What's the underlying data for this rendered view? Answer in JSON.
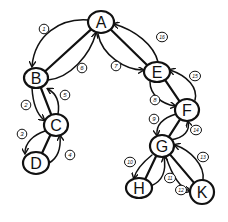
{
  "diagram": {
    "type": "directed-graph-traversal",
    "stroke_color": "#111111",
    "background": "#ffffff",
    "nodes": [
      {
        "id": "A",
        "label": "A",
        "x": 101,
        "y": 22,
        "rx": 13,
        "ry": 11
      },
      {
        "id": "B",
        "label": "B",
        "x": 36,
        "y": 78,
        "rx": 12,
        "ry": 10
      },
      {
        "id": "C",
        "label": "C",
        "x": 56,
        "y": 125,
        "rx": 12,
        "ry": 11
      },
      {
        "id": "D",
        "label": "D",
        "x": 36,
        "y": 163,
        "rx": 13,
        "ry": 11
      },
      {
        "id": "E",
        "label": "E",
        "x": 157,
        "y": 72,
        "rx": 13,
        "ry": 10
      },
      {
        "id": "F",
        "label": "F",
        "x": 187,
        "y": 110,
        "rx": 12,
        "ry": 11
      },
      {
        "id": "G",
        "label": "G",
        "x": 162,
        "y": 146,
        "rx": 12,
        "ry": 11
      },
      {
        "id": "H",
        "label": "H",
        "x": 139,
        "y": 188,
        "rx": 13,
        "ry": 10
      },
      {
        "id": "K",
        "label": "K",
        "x": 202,
        "y": 192,
        "rx": 12,
        "ry": 12
      }
    ],
    "undirected_lines": [
      {
        "from": "A",
        "to": "B"
      },
      {
        "from": "B",
        "to": "C"
      },
      {
        "from": "C",
        "to": "D"
      },
      {
        "from": "A",
        "to": "E"
      },
      {
        "from": "E",
        "to": "F"
      },
      {
        "from": "F",
        "to": "G"
      },
      {
        "from": "G",
        "to": "H"
      },
      {
        "from": "G",
        "to": "K"
      }
    ],
    "edges": [
      {
        "step": "1",
        "from": "A",
        "to": "B",
        "path": "M 88 20 C 60 18, 35 35, 32 66",
        "lx": 44,
        "ly": 29
      },
      {
        "step": "2",
        "from": "B",
        "to": "C",
        "path": "M 32 88 C 33 105, 38 115, 44 120",
        "lx": 26,
        "ly": 105
      },
      {
        "step": "3",
        "from": "C",
        "to": "D",
        "path": "M 45 131 C 33 135, 25 143, 25 153",
        "lx": 22,
        "ly": 134
      },
      {
        "step": "4",
        "from": "D",
        "to": "C",
        "path": "M 49 163 C 58 158, 61 148, 60 136",
        "lx": 70,
        "ly": 155
      },
      {
        "step": "5",
        "from": "C",
        "to": "B",
        "path": "M 58 114 C 60 102, 57 94, 48 89",
        "lx": 65,
        "ly": 95
      },
      {
        "step": "6",
        "from": "B",
        "to": "A",
        "path": "M 48 80 C 70 78, 90 55, 96 33",
        "lx": 82,
        "ly": 68
      },
      {
        "step": "7",
        "from": "A",
        "to": "E",
        "path": "M 98 34 C 102 55, 125 70, 143 70",
        "lx": 116,
        "ly": 66
      },
      {
        "step": "8",
        "from": "E",
        "to": "F",
        "path": "M 150 82 C 150 95, 162 104, 175 106",
        "lx": 155,
        "ly": 100
      },
      {
        "step": "9",
        "from": "F",
        "to": "G",
        "path": "M 176 114 C 163 118, 156 125, 157 135",
        "lx": 154,
        "ly": 119
      },
      {
        "step": "10",
        "from": "G",
        "to": "H",
        "path": "M 152 155 C 142 163, 136 170, 134 178",
        "lx": 130,
        "ly": 162
      },
      {
        "step": "11",
        "from": "H",
        "to": "G",
        "path": "M 151 186 C 165 180, 166 168, 164 157",
        "lx": 170,
        "ly": 178
      },
      {
        "step": "12",
        "from": "G",
        "to": "K",
        "path": "M 166 157 C 172 175, 180 188, 190 191",
        "lx": 181,
        "ly": 190
      },
      {
        "step": "13",
        "from": "K",
        "to": "G",
        "path": "M 203 180 C 205 165, 190 150, 175 145",
        "lx": 203,
        "ly": 157
      },
      {
        "step": "14",
        "from": "G",
        "to": "F",
        "path": "M 170 140 C 185 138, 190 130, 188 122",
        "lx": 196,
        "ly": 130
      },
      {
        "step": "15",
        "from": "F",
        "to": "E",
        "path": "M 195 100 C 198 88, 188 76, 170 70",
        "lx": 195,
        "ly": 76
      },
      {
        "step": "16",
        "from": "E",
        "to": "A",
        "path": "M 158 62 C 154 45, 135 30, 114 24",
        "lx": 162,
        "ly": 37
      }
    ]
  }
}
